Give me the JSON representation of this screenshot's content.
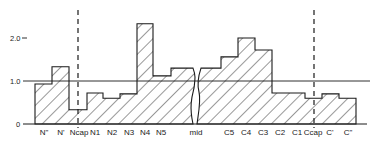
{
  "chart_data": {
    "type": "bar",
    "title": "",
    "xlabel": "",
    "ylabel": "",
    "ylim": [
      0,
      2.4
    ],
    "yticks": [
      {
        "value": 0,
        "label": "0"
      },
      {
        "value": 1.0,
        "label": "1.0"
      },
      {
        "value": 2.0,
        "label": "2.0"
      }
    ],
    "reference_line": {
      "value": 1.0,
      "style": "solid"
    },
    "grid": false,
    "legend": null,
    "fill_pattern": "diagonal-hatch",
    "axis_break": {
      "after_category": "mid",
      "style": "wavy"
    },
    "dashed_markers": [
      {
        "at_category": "Ncap"
      },
      {
        "at_category": "Ccap"
      }
    ],
    "categories": [
      "N\"",
      "N'",
      "Ncap",
      "N1",
      "N2",
      "N3",
      "N4",
      "N5",
      "mid",
      "C5",
      "C4",
      "C3",
      "C2",
      "C1",
      "Ccap",
      "C'",
      "C\""
    ],
    "values": [
      0.93,
      1.33,
      0.33,
      0.72,
      0.6,
      0.7,
      2.33,
      1.12,
      1.3,
      1.56,
      2.0,
      1.72,
      0.72,
      0.72,
      0.6,
      0.7,
      0.6
    ]
  },
  "colors": {
    "stroke": "#1a1a1a",
    "hatch": "#333333",
    "background": "#ffffff"
  }
}
